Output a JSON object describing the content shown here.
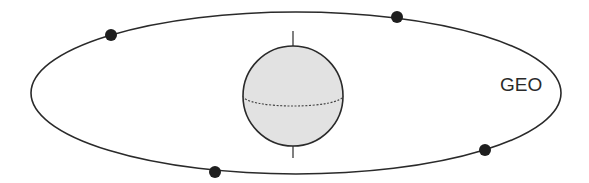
{
  "diagram": {
    "orbit": {
      "label": "GEO",
      "cx": 296,
      "cy": 93,
      "rx": 265,
      "ry": 81,
      "stroke": "#2a2a2a"
    },
    "earth": {
      "cx": 293,
      "cy": 96,
      "r": 50,
      "fill": "#e2e2e2",
      "stroke": "#2a2a2a",
      "axis_top": 31,
      "axis_bottom": 158,
      "equator_ry": 10
    },
    "satellites": [
      {
        "name": "satellite-1",
        "x": 111,
        "y": 35
      },
      {
        "name": "satellite-2",
        "x": 397,
        "y": 17
      },
      {
        "name": "satellite-3",
        "x": 485,
        "y": 150
      },
      {
        "name": "satellite-4",
        "x": 215,
        "y": 172
      }
    ],
    "satellite_radius": 6,
    "satellite_color": "#1e1e1e"
  }
}
